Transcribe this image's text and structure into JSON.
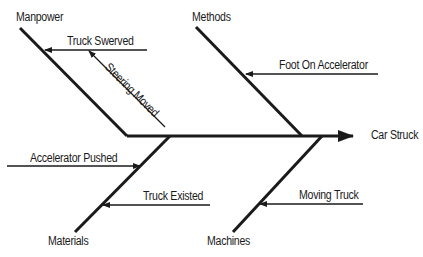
{
  "diagram": {
    "type": "fishbone",
    "effect": "Car Struck",
    "categories": [
      {
        "name": "Manpower",
        "causes": [
          "Truck Swerved",
          "Steering Moved"
        ]
      },
      {
        "name": "Methods",
        "causes": [
          "Foot On Accelerator"
        ]
      },
      {
        "name": "Materials",
        "causes": [
          "Accelerator Pushed",
          "Truck Existed"
        ]
      },
      {
        "name": "Machines",
        "causes": [
          "Moving Truck"
        ]
      }
    ],
    "line_color": "#1a1a1a"
  }
}
